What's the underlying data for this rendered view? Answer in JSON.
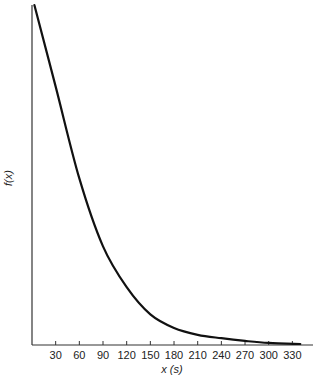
{
  "chart_data": {
    "type": "line",
    "title": "",
    "xlabel": "x (s)",
    "ylabel": "f(x)",
    "xlim": [
      0,
      355
    ],
    "ylim": [
      0,
      1
    ],
    "grid": false,
    "legend": null,
    "x_ticks": [
      30,
      60,
      90,
      120,
      150,
      180,
      210,
      240,
      270,
      300,
      330
    ],
    "y_ticks": [],
    "series": [
      {
        "name": "f(x)",
        "color": "#111111",
        "x": [
          3,
          30,
          60,
          90,
          120,
          150,
          180,
          210,
          240,
          270,
          300,
          340
        ],
        "values": [
          1.0,
          0.76,
          0.49,
          0.29,
          0.17,
          0.09,
          0.05,
          0.03,
          0.02,
          0.012,
          0.006,
          0.003
        ]
      }
    ]
  },
  "labels": {
    "xlabel": "x (s)",
    "ylabel": "f(x)"
  }
}
